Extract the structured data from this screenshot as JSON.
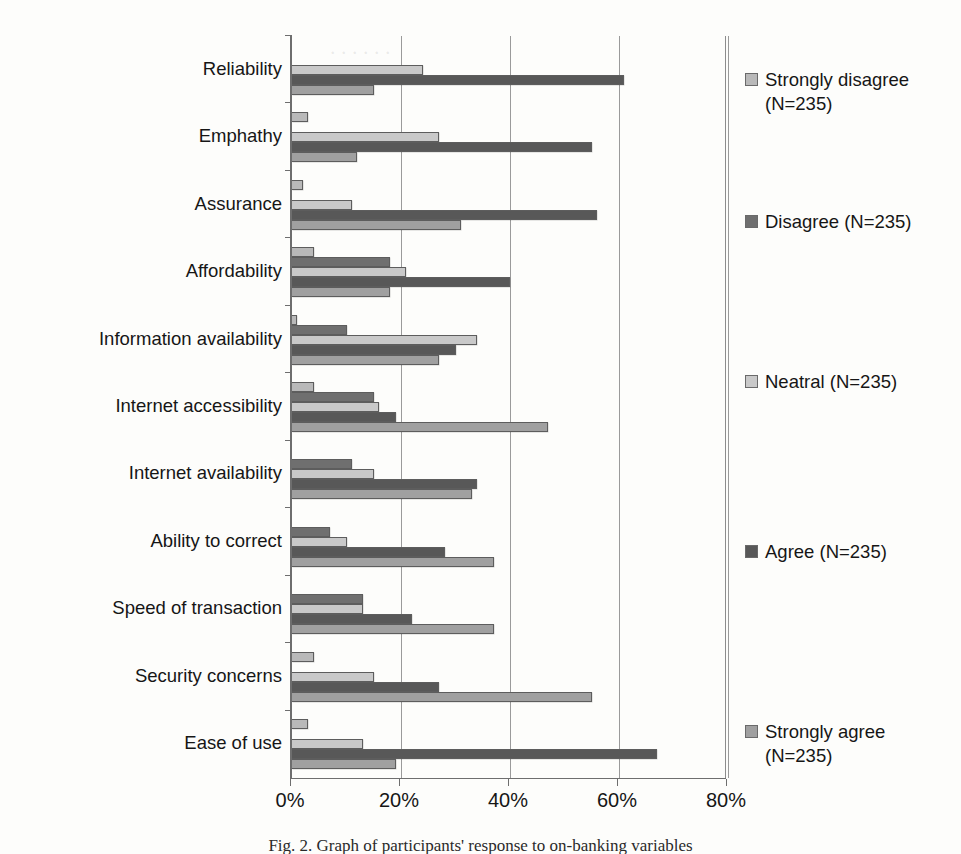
{
  "chart_data": {
    "type": "bar",
    "orientation": "horizontal",
    "title": "",
    "xlabel": "",
    "ylabel": "",
    "xlim": [
      0,
      80
    ],
    "xticks": [
      "0%",
      "20%",
      "40%",
      "60%",
      "80%"
    ],
    "xtick_values": [
      0,
      20,
      40,
      60,
      80
    ],
    "grid": true,
    "legend_position": "right",
    "categories": [
      "Reliability",
      "Emphathy",
      "Assurance",
      "Affordability",
      "Information availability",
      "Internet accessibility",
      "Internet availability",
      "Ability to correct",
      "Speed of transaction",
      "Security concerns",
      "Ease of use"
    ],
    "series": [
      {
        "name": "Strongly disagree (N=235)",
        "short_name": "Strongly disagree",
        "color": "#b9b9b9",
        "values": [
          0,
          3,
          2,
          4,
          1,
          4,
          0,
          0,
          0,
          4,
          3
        ]
      },
      {
        "name": "Disagree (N=235)",
        "short_name": "Disagree",
        "color": "#6f6f6f",
        "values": [
          0,
          0,
          0,
          18,
          10,
          15,
          11,
          7,
          13,
          0,
          0
        ]
      },
      {
        "name": "Neatral (N=235)",
        "short_name": "Neatral",
        "color": "#c9c9c9",
        "values": [
          24,
          27,
          11,
          21,
          34,
          16,
          15,
          10,
          13,
          15,
          13
        ]
      },
      {
        "name": "Agree (N=235)",
        "short_name": "Agree",
        "color": "#585858",
        "values": [
          61,
          55,
          56,
          40,
          30,
          19,
          34,
          28,
          22,
          27,
          67
        ]
      },
      {
        "name": "Strongly agree (N=235)",
        "short_name": "Strongly agree",
        "color": "#a0a0a0",
        "values": [
          15,
          12,
          31,
          18,
          27,
          47,
          33,
          37,
          37,
          55,
          19
        ]
      }
    ]
  },
  "legend": {
    "entries": [
      {
        "label": "Strongly disagree (N=235)",
        "swatch": "s0"
      },
      {
        "label": "Disagree (N=235)",
        "swatch": "s1"
      },
      {
        "label": "Neatral (N=235)",
        "swatch": "s2"
      },
      {
        "label": "Agree (N=235)",
        "swatch": "s3"
      },
      {
        "label": "Strongly agree (N=235)",
        "swatch": "s4"
      }
    ]
  },
  "caption": {
    "text": "Fig. 2.  Graph of participants' response to on-banking variables"
  }
}
